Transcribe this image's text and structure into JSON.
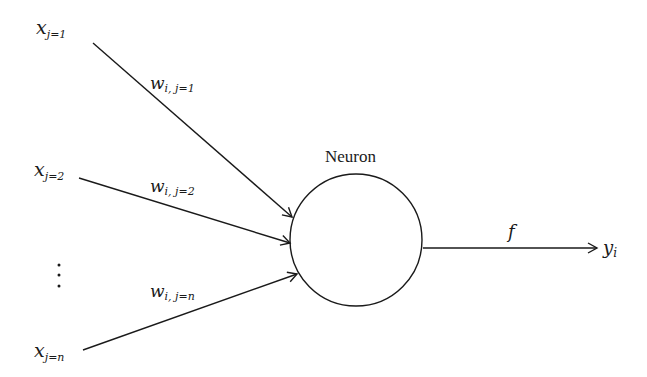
{
  "diagram": {
    "type": "perceptron-neuron",
    "neuron": {
      "label": "Neuron",
      "center": [
        356,
        240
      ],
      "radius": 66
    },
    "inputs": [
      {
        "var": "x",
        "sub": "j=1",
        "weight_var": "w",
        "weight_sub": "i, j=1",
        "from": [
          93,
          43
        ],
        "to": [
          293,
          218
        ]
      },
      {
        "var": "x",
        "sub": "j=2",
        "weight_var": "w",
        "weight_sub": "i, j=2",
        "from": [
          79,
          178
        ],
        "to": [
          291,
          243
        ]
      },
      {
        "var": "x",
        "sub": "j=n",
        "weight_var": "w",
        "weight_sub": "i, j=n",
        "from": [
          83,
          350
        ],
        "to": [
          298,
          274
        ]
      }
    ],
    "ellipsis": "⋮",
    "output": {
      "function": "f",
      "var": "y",
      "sub": "i",
      "from": [
        423,
        248
      ],
      "to": [
        598,
        248
      ]
    },
    "colors": {
      "stroke": "#1a1a1a",
      "background": "#ffffff"
    }
  }
}
